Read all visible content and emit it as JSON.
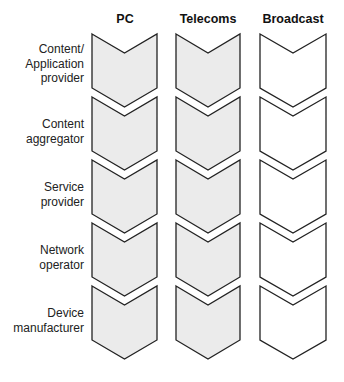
{
  "diagram": {
    "columns": [
      {
        "label": "PC",
        "fill": "#ebebeb"
      },
      {
        "label": "Telecoms",
        "fill": "#ebebeb"
      },
      {
        "label": "Broadcast",
        "fill": "#ffffff"
      }
    ],
    "rows": [
      {
        "label_lines": [
          "Content/",
          "Application",
          "provider"
        ]
      },
      {
        "label_lines": [
          "Content",
          "aggregator"
        ]
      },
      {
        "label_lines": [
          "Service",
          "provider"
        ]
      },
      {
        "label_lines": [
          "Network",
          "operator"
        ]
      },
      {
        "label_lines": [
          "Device",
          "manufacturer"
        ]
      }
    ],
    "stroke_color": "#222222"
  }
}
